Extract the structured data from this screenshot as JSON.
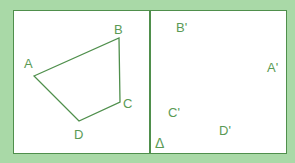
{
  "figure": {
    "colors": {
      "background": "#a9d9a7",
      "panel": "#ffffff",
      "line": "#4f8f4c",
      "label": "#5a9a55"
    },
    "left_panel": {
      "shape": "quadrilateral",
      "vertices": {
        "A": [
          34,
          76
        ],
        "B": [
          119,
          38
        ],
        "C": [
          120,
          102
        ],
        "D": [
          79,
          121
        ]
      },
      "labels": {
        "A": "A",
        "B": "B",
        "C": "C",
        "D": "D"
      }
    },
    "right_panel": {
      "labels": {
        "A_prime": "A'",
        "B_prime": "B'",
        "C_prime": "C'",
        "D_prime": "D'",
        "delta": "Δ"
      }
    }
  }
}
